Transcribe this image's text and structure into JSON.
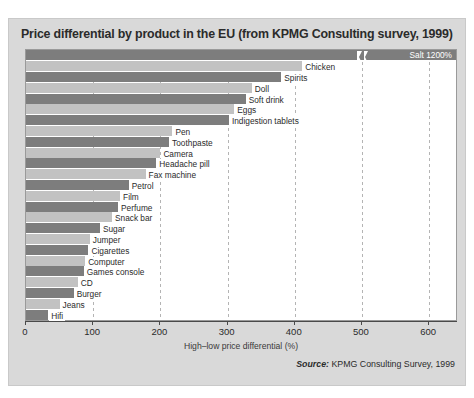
{
  "title": "Price differential by product in the EU (from KPMG Consulting survey, 1999)",
  "source_prefix": "Source:",
  "source_text": "KPMG Consulting Survey, 1999",
  "colors": {
    "bar_dark": "#7d7d7d",
    "bar_light": "#c2c2c2",
    "panel": "#d9d9d9",
    "plot": "#ffffff"
  },
  "chart_data": {
    "type": "bar",
    "orientation": "horizontal",
    "title": "Price differential by product in the EU (from KPMG Consulting survey, 1999)",
    "xlabel": "High–low price differential (%)",
    "ylabel": "",
    "xlim": [
      0,
      640
    ],
    "xticks": [
      0,
      100,
      200,
      300,
      400,
      500,
      600
    ],
    "xticklabels": [
      "0",
      "100",
      "200",
      "300",
      "400",
      "500",
      "600"
    ],
    "grid": true,
    "grid_axis": "x",
    "legend": false,
    "annotations": [
      "Salt 1200%"
    ],
    "axis_break": {
      "present": true,
      "value": 500,
      "note": "bar truncated, true value 1200%"
    },
    "categories": [
      "Salt",
      "Chicken",
      "Spirits",
      "Doll",
      "Soft drink",
      "Eggs",
      "Indigestion tablets",
      "Pen",
      "Toothpaste",
      "Camera",
      "Headache pill",
      "Fax machine",
      "Petrol",
      "Film",
      "Perfume",
      "Snack bar",
      "Sugar",
      "Jumper",
      "Cigarettes",
      "Computer",
      "Games console",
      "CD",
      "Burger",
      "Jeans",
      "Hifi"
    ],
    "values": [
      640,
      411,
      380,
      336,
      327,
      310,
      302,
      218,
      213,
      200,
      194,
      178,
      153,
      140,
      137,
      128,
      110,
      95,
      93,
      88,
      86,
      77,
      71,
      50,
      33
    ],
    "bars": [
      {
        "label": "Salt 1200%",
        "value": 640,
        "shade": "dark",
        "label_pos": "inside-end"
      },
      {
        "label": "Chicken",
        "value": 411,
        "shade": "light",
        "label_pos": "outside"
      },
      {
        "label": "Spirits",
        "value": 380,
        "shade": "dark",
        "label_pos": "outside"
      },
      {
        "label": "Doll",
        "value": 336,
        "shade": "light",
        "label_pos": "outside"
      },
      {
        "label": "Soft drink",
        "value": 327,
        "shade": "dark",
        "label_pos": "outside"
      },
      {
        "label": "Eggs",
        "value": 310,
        "shade": "light",
        "label_pos": "outside"
      },
      {
        "label": "Indigestion tablets",
        "value": 302,
        "shade": "dark",
        "label_pos": "outside"
      },
      {
        "label": "Pen",
        "value": 218,
        "shade": "light",
        "label_pos": "outside"
      },
      {
        "label": "Toothpaste",
        "value": 213,
        "shade": "dark",
        "label_pos": "outside"
      },
      {
        "label": "Camera",
        "value": 200,
        "shade": "light",
        "label_pos": "outside"
      },
      {
        "label": "Headache pill",
        "value": 194,
        "shade": "dark",
        "label_pos": "outside"
      },
      {
        "label": "Fax machine",
        "value": 178,
        "shade": "light",
        "label_pos": "outside"
      },
      {
        "label": "Petrol",
        "value": 153,
        "shade": "dark",
        "label_pos": "outside"
      },
      {
        "label": "Film",
        "value": 140,
        "shade": "light",
        "label_pos": "outside"
      },
      {
        "label": "Perfume",
        "value": 137,
        "shade": "dark",
        "label_pos": "outside"
      },
      {
        "label": "Snack bar",
        "value": 128,
        "shade": "light",
        "label_pos": "outside"
      },
      {
        "label": "Sugar",
        "value": 110,
        "shade": "dark",
        "label_pos": "outside"
      },
      {
        "label": "Jumper",
        "value": 95,
        "shade": "light",
        "label_pos": "outside"
      },
      {
        "label": "Cigarettes",
        "value": 93,
        "shade": "dark",
        "label_pos": "outside"
      },
      {
        "label": "Computer",
        "value": 88,
        "shade": "light",
        "label_pos": "outside"
      },
      {
        "label": "Games console",
        "value": 86,
        "shade": "dark",
        "label_pos": "outside"
      },
      {
        "label": "CD",
        "value": 77,
        "shade": "light",
        "label_pos": "outside"
      },
      {
        "label": "Burger",
        "value": 71,
        "shade": "dark",
        "label_pos": "outside"
      },
      {
        "label": "Jeans",
        "value": 50,
        "shade": "light",
        "label_pos": "outside"
      },
      {
        "label": "Hifi",
        "value": 33,
        "shade": "dark",
        "label_pos": "outside"
      }
    ]
  }
}
